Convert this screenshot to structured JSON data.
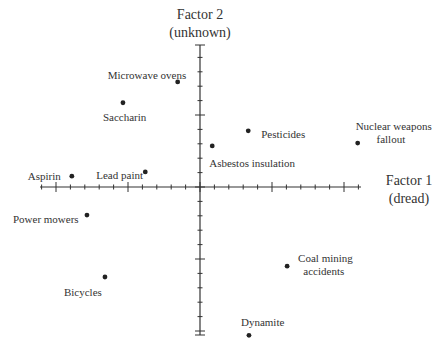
{
  "chart_data": {
    "type": "scatter",
    "title": "",
    "xlabel": "Factor 1 (dread)",
    "ylabel": "Factor 2 (unknown)",
    "x_title_lines": [
      "Factor 1",
      "(dread)"
    ],
    "y_title_lines": [
      "Factor 2",
      "(unknown)"
    ],
    "xlim": [
      -2.2,
      2.2
    ],
    "ylim": [
      -2.05,
      1.95
    ],
    "grid": false,
    "legend": "none",
    "tick_minor_step": 0.2,
    "tick_major_step": 1.0,
    "points": [
      {
        "label": "Microwave ovens",
        "x": -0.31,
        "y": 1.46
      },
      {
        "label": "Saccharin",
        "x": -1.07,
        "y": 1.17
      },
      {
        "label": "Aspirin",
        "x": -1.78,
        "y": 0.15
      },
      {
        "label": "Lead paint",
        "x": -0.76,
        "y": 0.21
      },
      {
        "label": "Asbestos insulation",
        "x": 0.17,
        "y": 0.57
      },
      {
        "label": "Pesticides",
        "x": 0.67,
        "y": 0.78
      },
      {
        "label": "Nuclear weapons fallout",
        "x": 2.19,
        "y": 0.61
      },
      {
        "label": "Power mowers",
        "x": -1.57,
        "y": -0.39
      },
      {
        "label": "Bicycles",
        "x": -1.32,
        "y": -1.25
      },
      {
        "label": "Coal mining accidents",
        "x": 1.21,
        "y": -1.1
      },
      {
        "label": "Dynamite",
        "x": 0.68,
        "y": -2.06
      }
    ]
  },
  "layout": {
    "origin_px": [
      200,
      187
    ],
    "unit_px": 72,
    "x_axis_px": [
      40,
      361
    ],
    "y_axis_px": [
      45,
      335
    ],
    "label_positions": [
      {
        "dx": -70,
        "dy": -7,
        "lines": [
          "Microwave ovens"
        ],
        "anchor": "start"
      },
      {
        "dx": -20,
        "dy": 14,
        "lines": [
          "Saccharin"
        ],
        "anchor": "start"
      },
      {
        "dx": -44,
        "dy": 0,
        "lines": [
          "Aspirin"
        ],
        "anchor": "start"
      },
      {
        "dx": -49,
        "dy": 3,
        "lines": [
          "Lead paint"
        ],
        "anchor": "start"
      },
      {
        "dx": -3,
        "dy": 17,
        "lines": [
          "Asbestos insulation"
        ],
        "anchor": "start"
      },
      {
        "dx": 13,
        "dy": 3,
        "lines": [
          "Pesticides"
        ],
        "anchor": "start"
      },
      {
        "dx": -2,
        "dy": -17,
        "lines": [
          "Nuclear weapons",
          "fallout"
        ],
        "anchor": "start"
      },
      {
        "dx": -74,
        "dy": 4,
        "lines": [
          "Power mowers"
        ],
        "anchor": "start"
      },
      {
        "dx": -41,
        "dy": 15,
        "lines": [
          "Bicycles"
        ],
        "anchor": "start"
      },
      {
        "dx": 11,
        "dy": -8,
        "lines": [
          "Coal mining",
          "accidents"
        ],
        "anchor": "start"
      },
      {
        "dx": -8,
        "dy": -13,
        "lines": [
          "Dynamite"
        ],
        "anchor": "start"
      }
    ]
  }
}
